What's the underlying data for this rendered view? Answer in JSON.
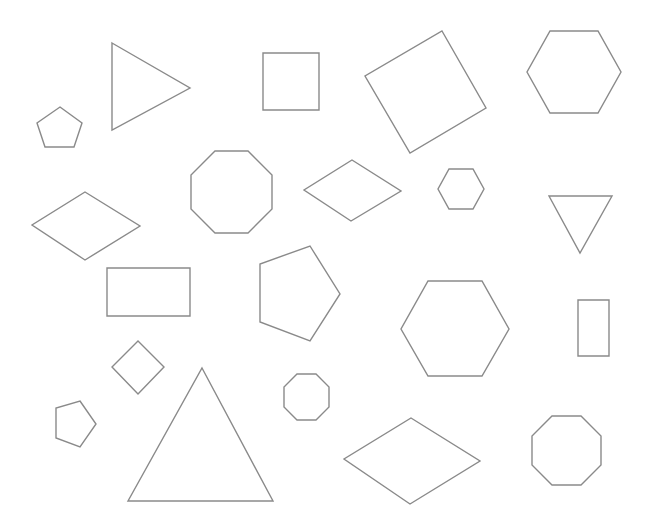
{
  "canvas": {
    "width": 650,
    "height": 525,
    "background": "#ffffff",
    "stroke": "#8a8a8a"
  },
  "shapes": [
    {
      "name": "pentagon-small-top-left",
      "type": "pentagon",
      "points": "60,107 82,123 74,147 45,147 37,123"
    },
    {
      "name": "triangle-right-pointing",
      "type": "triangle",
      "points": "112,43 190,88 112,130"
    },
    {
      "name": "square-top",
      "type": "square",
      "points": "263,53 319,53 319,110 263,110"
    },
    {
      "name": "square-rotated-large",
      "type": "square",
      "points": "442,31 486,108 410,153 365,76"
    },
    {
      "name": "hexagon-top-right",
      "type": "hexagon",
      "points": "550,31 598,31 621,72 598,113 550,113 527,72"
    },
    {
      "name": "octagon-large-middle-left",
      "type": "octagon",
      "points": "215,151 248,151 272,175 272,209 248,233 215,233 191,209 191,175"
    },
    {
      "name": "rhombus-middle",
      "type": "rhombus",
      "points": "352,160 401,191 351,221 304,190"
    },
    {
      "name": "hexagon-small-middle",
      "type": "hexagon",
      "points": "449,169 473,169 484,189 473,209 449,209 438,189"
    },
    {
      "name": "triangle-down-pointing",
      "type": "triangle",
      "points": "549,196 612,196 580,253"
    },
    {
      "name": "rhombus-left",
      "type": "rhombus",
      "points": "85,192 140,226 85,260 32,225"
    },
    {
      "name": "rectangle-wide",
      "type": "rectangle",
      "points": "107,268 190,268 190,316 107,316"
    },
    {
      "name": "pentagon-large-middle",
      "type": "pentagon",
      "points": "310,246 340,294 310,341 260,322 260,264"
    },
    {
      "name": "hexagon-large-center-right",
      "type": "hexagon",
      "points": "428,281 482,281 509,329 482,376 428,376 401,329"
    },
    {
      "name": "rectangle-tall",
      "type": "rectangle",
      "points": "578,300 609,300 609,356 578,356"
    },
    {
      "name": "diamond-small",
      "type": "square",
      "points": "138,341 164,367 138,394 112,367"
    },
    {
      "name": "triangle-large-bottom",
      "type": "triangle",
      "points": "202,368 273,501 128,501"
    },
    {
      "name": "octagon-small-center",
      "type": "octagon",
      "points": "297,374 316,374 329,387 329,407 316,420 297,420 284,407 284,387"
    },
    {
      "name": "pentagon-small-bottom-left",
      "type": "pentagon",
      "points": "80,401 96,424 80,447 56,438 56,408"
    },
    {
      "name": "rhombus-bottom",
      "type": "rhombus",
      "points": "411,418 480,461 410,504 344,459"
    },
    {
      "name": "octagon-bottom-right",
      "type": "octagon",
      "points": "552,416 581,416 601,436 601,465 581,485 552,485 532,465 532,436"
    }
  ]
}
